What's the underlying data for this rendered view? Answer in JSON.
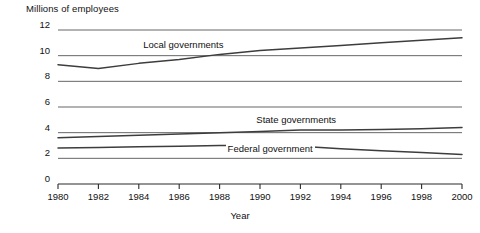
{
  "chart_data": {
    "type": "line",
    "title": "",
    "ylabel": "Millions of employees",
    "xlabel": "Year",
    "xlim": [
      1980,
      2000
    ],
    "ylim": [
      0,
      12
    ],
    "grid": true,
    "legend_position": "inline-annotations",
    "y_ticks": [
      "0",
      "2",
      "4",
      "6",
      "8",
      "10",
      "12"
    ],
    "y_tick_values": [
      0,
      2,
      4,
      6,
      8,
      10,
      12
    ],
    "x_ticks": [
      "1980",
      "1982",
      "1984",
      "1986",
      "1988",
      "1990",
      "1992",
      "1994",
      "1996",
      "1998",
      "2000"
    ],
    "x": [
      1980,
      1982,
      1984,
      1986,
      1988,
      1990,
      1992,
      1994,
      1996,
      1998,
      2000
    ],
    "series": [
      {
        "name": "Local governments",
        "label": "Local governments",
        "color": "#3d3d3d",
        "values": [
          9.3,
          9.0,
          9.4,
          9.7,
          10.1,
          10.4,
          10.6,
          10.8,
          11.0,
          11.2,
          11.4
        ]
      },
      {
        "name": "State governments",
        "label": "State governments",
        "color": "#3d3d3d",
        "values": [
          3.6,
          3.7,
          3.8,
          3.9,
          4.0,
          4.1,
          4.2,
          4.2,
          4.25,
          4.3,
          4.4
        ]
      },
      {
        "name": "Federal government",
        "label": "Federal government",
        "color": "#3d3d3d",
        "values": [
          2.8,
          2.85,
          2.9,
          2.95,
          3.0,
          3.0,
          2.95,
          2.75,
          2.6,
          2.45,
          2.3
        ]
      }
    ],
    "annotations": [
      {
        "text": "Local governments",
        "x": 1986.2,
        "y": 10.85
      },
      {
        "text": "State governments",
        "x": 1991.8,
        "y": 4.95
      },
      {
        "text": "Federal government",
        "x": 1990.5,
        "y": 2.75
      }
    ],
    "colors": {
      "gridline": "#555555",
      "axis": "#2b2b2b",
      "line": "#3d3d3d",
      "text": "#111111",
      "background": "#ffffff"
    }
  }
}
